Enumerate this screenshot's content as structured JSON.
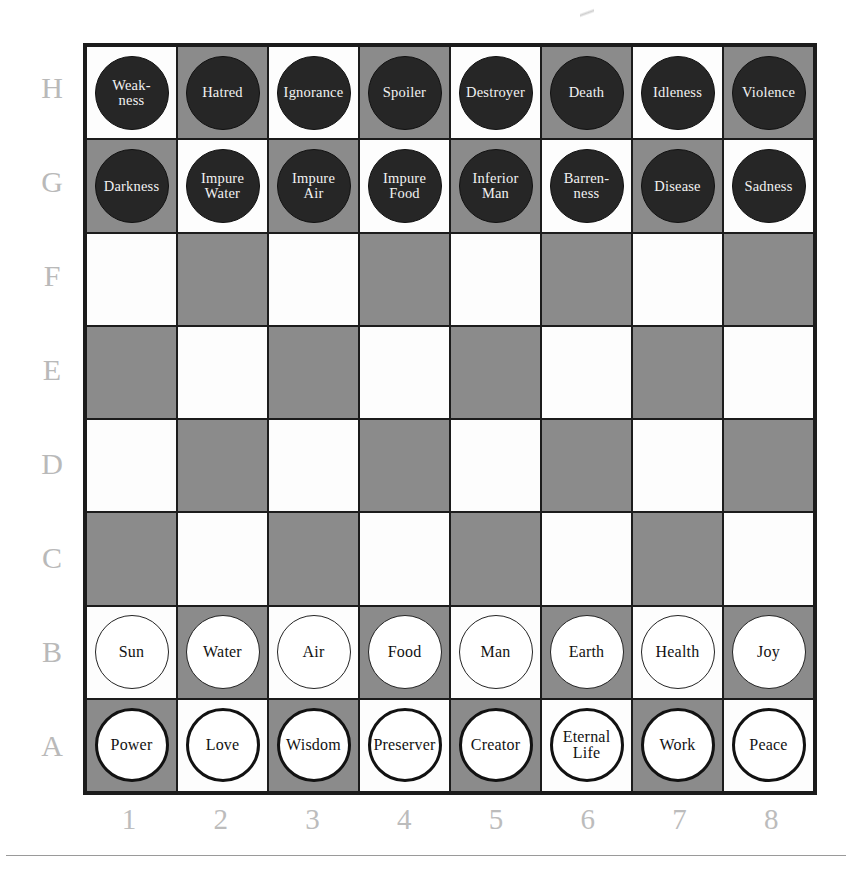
{
  "board": {
    "rank_labels": [
      "H",
      "G",
      "F",
      "E",
      "D",
      "C",
      "B",
      "A"
    ],
    "file_labels": [
      "1",
      "2",
      "3",
      "4",
      "5",
      "6",
      "7",
      "8"
    ],
    "colors": {
      "light_square": "#fdfdfd",
      "dark_square": "#8b8b8b",
      "border": "#1c1c1c",
      "black_piece_fill": "#262626",
      "black_piece_text": "#f2f2f2",
      "white_piece_fill": "#ffffff",
      "white_piece_text": "#121212",
      "coordinate_text": "#bcbcbc"
    },
    "ranks": [
      {
        "rank": "H",
        "piece_style": "black",
        "first_square": "light",
        "pieces": [
          "Weak-\nness",
          "Hatred",
          "Ignorance",
          "Spoiler",
          "Destroyer",
          "Death",
          "Idleness",
          "Violence"
        ]
      },
      {
        "rank": "G",
        "piece_style": "black",
        "first_square": "dark",
        "pieces": [
          "Darkness",
          "Impure\nWater",
          "Impure\nAir",
          "Impure\nFood",
          "Inferior\nMan",
          "Barren-\nness",
          "Disease",
          "Sadness"
        ]
      },
      {
        "rank": "F",
        "piece_style": "none",
        "first_square": "light",
        "pieces": [
          "",
          "",
          "",
          "",
          "",
          "",
          "",
          ""
        ]
      },
      {
        "rank": "E",
        "piece_style": "none",
        "first_square": "dark",
        "pieces": [
          "",
          "",
          "",
          "",
          "",
          "",
          "",
          ""
        ]
      },
      {
        "rank": "D",
        "piece_style": "none",
        "first_square": "light",
        "pieces": [
          "",
          "",
          "",
          "",
          "",
          "",
          "",
          ""
        ]
      },
      {
        "rank": "C",
        "piece_style": "none",
        "first_square": "dark",
        "pieces": [
          "",
          "",
          "",
          "",
          "",
          "",
          "",
          ""
        ]
      },
      {
        "rank": "B",
        "piece_style": "white-thin",
        "first_square": "light",
        "pieces": [
          "Sun",
          "Water",
          "Air",
          "Food",
          "Man",
          "Earth",
          "Health",
          "Joy"
        ]
      },
      {
        "rank": "A",
        "piece_style": "white-thick",
        "first_square": "dark",
        "pieces": [
          "Power",
          "Love",
          "Wisdom",
          "Preserver",
          "Creator",
          "Eternal\nLife",
          "Work",
          "Peace"
        ]
      }
    ]
  }
}
